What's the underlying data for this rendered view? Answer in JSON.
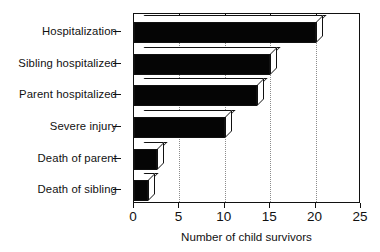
{
  "chart_data": {
    "type": "bar",
    "orientation": "horizontal",
    "title": "",
    "xlabel": "Number of child survivors",
    "ylabel": "",
    "categories": [
      "Hospitalization",
      "Sibling hospitalized",
      "Parent hospitalized",
      "Severe injury",
      "Death of parent",
      "Death of sibling"
    ],
    "values": [
      20,
      15,
      13.5,
      10,
      2.5,
      1.5
    ],
    "xlim": [
      0,
      25
    ],
    "xticks": [
      0,
      5,
      10,
      15,
      20,
      25
    ],
    "xticklabels": [
      "0",
      "5",
      "10",
      "15",
      "20",
      "25"
    ],
    "grid": "vertical-dotted",
    "legend": "none",
    "bar_style": "3d-extruded",
    "colors": {
      "bar_face": "#050505",
      "bar_extrude": "#ffffff",
      "outline": "#111111",
      "gridline": "#8c8c8c",
      "background": "#ffffff"
    }
  }
}
